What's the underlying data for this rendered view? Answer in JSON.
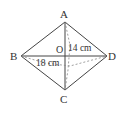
{
  "diagram": {
    "type": "rhombus with diagonals",
    "vertices": {
      "A": "A",
      "B": "B",
      "C": "C",
      "D": "D",
      "O": "O"
    },
    "measurements": {
      "ao_label": "14 cm",
      "bo_label": "18 cm"
    },
    "colors": {
      "line": "#444444",
      "dashed": "#888888",
      "text": "#333333"
    }
  }
}
